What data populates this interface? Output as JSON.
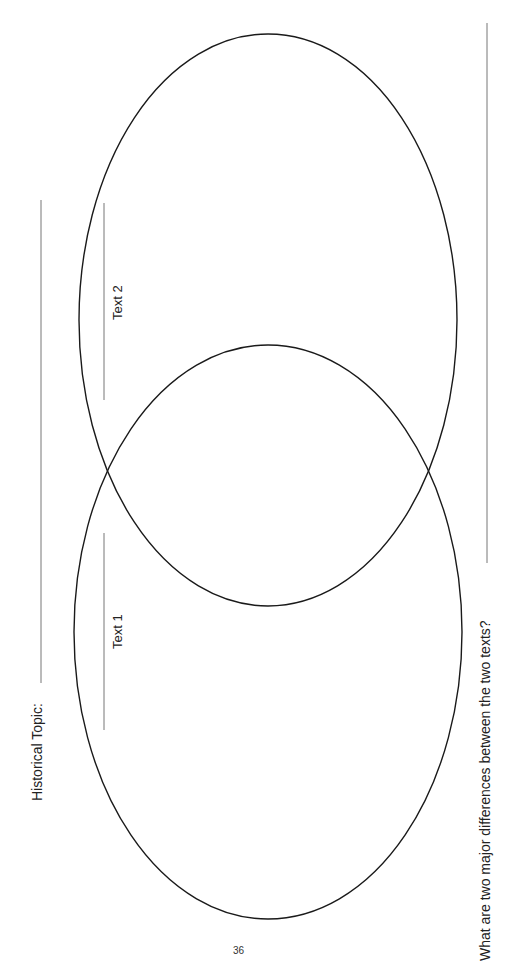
{
  "worksheet": {
    "topic_label": "Historical Topic:",
    "topic_value": "",
    "venn": {
      "left_circle_label": "Text 1",
      "right_circle_label": "Text 2"
    },
    "question": "What are two major differences between the two texts?",
    "answer": "",
    "page_number": "36"
  },
  "colors": {
    "ellipse_stroke": "#1a1a1a",
    "line_stroke": "#777777",
    "text": "#222222"
  }
}
